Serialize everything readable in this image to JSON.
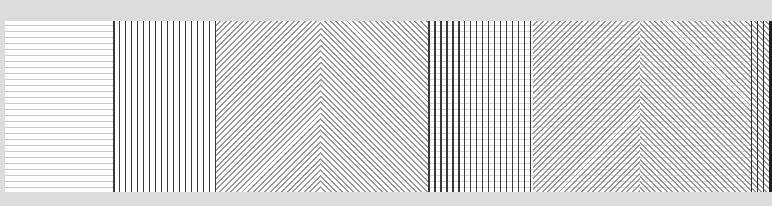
{
  "image": {
    "description": "Strip of six line-pattern panels (optical pattern samples)",
    "background_color": "#dcdcdc",
    "strip_color": "#ffffff"
  },
  "panels": [
    {
      "index": 1,
      "pattern": "horizontal-lines",
      "line_color": "#c8c8c8",
      "spacing_px": 6,
      "x_start": 0,
      "width": 108
    },
    {
      "index": 2,
      "pattern": "vertical-lines",
      "line_color": "#3a3a3a",
      "spacing_px": 6,
      "x_start": 108,
      "width": 103
    },
    {
      "index": 3,
      "pattern": "chevron-diagonal",
      "line_color": "#9a9a9a",
      "peak_x": 316,
      "x_start": 211,
      "width": 212
    },
    {
      "index": 4,
      "pattern": "vertical-over-horizontal",
      "line_color": "#3a3a3a",
      "background_line_color": "#d4d4d4",
      "x_start": 423,
      "width": 105
    },
    {
      "index": 5,
      "pattern": "chevron-over-horizontal",
      "line_color": "#9a9a9a",
      "background_line_color": "#dadada",
      "peak_x": 635,
      "x_start": 528,
      "width": 218
    },
    {
      "index": 6,
      "pattern": "vertical-over-diagonal",
      "line_color": "#2e2e2e",
      "x_start": 746,
      "width": 21
    }
  ]
}
